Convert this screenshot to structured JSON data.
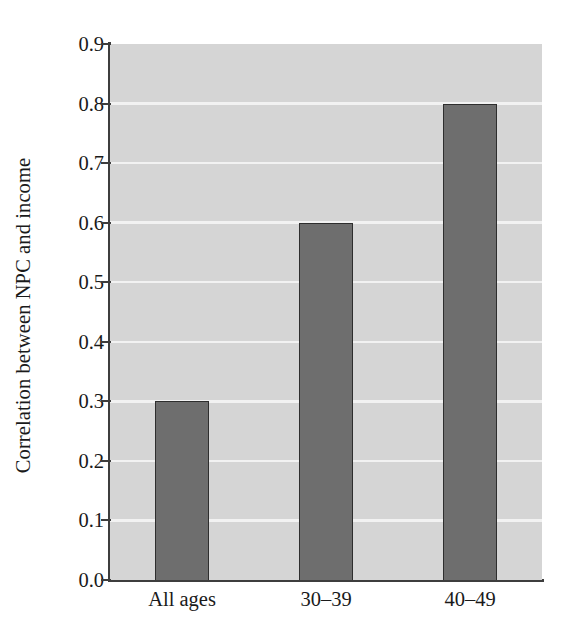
{
  "chart_data": {
    "type": "bar",
    "title": "",
    "subtitle": "",
    "xlabel": "",
    "ylabel": "Correlation between NPC and income",
    "categories": [
      "All ages",
      "30–39",
      "40–49"
    ],
    "values": [
      0.3,
      0.6,
      0.8
    ],
    "series": [
      {
        "name": "Correlation between NPC and income",
        "values": [
          0.3,
          0.6,
          0.8
        ]
      }
    ],
    "ylim": [
      0.0,
      0.9
    ],
    "xlim": [
      0,
      3
    ],
    "ytick_labels": [
      "0.9",
      "0.8",
      "0.7",
      "0.6",
      "0.5",
      "0.4",
      "0.3",
      "0.2",
      "0.1",
      "0.0"
    ],
    "ytick_values": [
      0.9,
      0.8,
      0.7,
      0.6,
      0.5,
      0.4,
      0.3,
      0.2,
      0.1,
      0.0
    ],
    "ytick_interval": 0.1,
    "gridlines": {
      "horizontal": true,
      "vertical": false,
      "color": "#f2f2f2",
      "at_values": [
        0.1,
        0.2,
        0.3,
        0.4,
        0.5,
        0.6,
        0.7,
        0.8
      ]
    },
    "legend": {
      "visible": false,
      "position": "none",
      "entries": []
    },
    "annotations": [],
    "colors": {
      "bar_fill": "#6e6e6e",
      "bar_edge": "#2e2e2e",
      "plot_background": "#d5d5d5",
      "figure_background": "#ffffff",
      "axis_line": "#3d3d3d",
      "grid": "#f2f2f2",
      "text": "#1a1a1a"
    },
    "bar_width_fraction": 0.38
  }
}
